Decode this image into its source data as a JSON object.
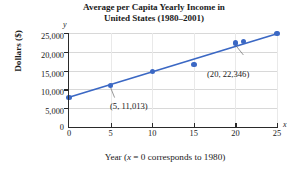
{
  "chart_data": {
    "type": "scatter",
    "title": "Average per Capita Yearly Income in United States (1980–2001)",
    "title_lines": [
      "Average per Capita Yearly Income in",
      "United States (1980–2001)"
    ],
    "xlabel": "Year (x = 0 corresponds to 1980)",
    "xlabel_parts": {
      "pre": "Year (",
      "italic": "x",
      "post": " = 0 corresponds to 1980)"
    },
    "ylabel": "Dollars ($)",
    "x_axis_name": "x",
    "y_axis_name": "y",
    "xlim": [
      0,
      25
    ],
    "ylim": [
      0,
      25000
    ],
    "xticks": [
      0,
      5,
      10,
      15,
      20,
      25
    ],
    "xtick_labels": [
      "0",
      "5",
      "10",
      "15",
      "20",
      "25"
    ],
    "yticks": [
      0,
      5000,
      10000,
      15000,
      20000,
      25000
    ],
    "ytick_labels": [
      "0",
      "5,000",
      "10,000",
      "15,000",
      "20,000",
      "25,000"
    ],
    "grid": true,
    "legend": false,
    "series_color": "#3b68c4",
    "grid_color": "#d8d8d8",
    "axis_color": "#2a2a2a",
    "x": [
      0,
      5,
      10,
      15,
      20,
      21,
      25
    ],
    "values": [
      7900,
      11013,
      14800,
      16700,
      22346,
      22800,
      24800
    ],
    "points": [
      {
        "x": 0,
        "y": 7900
      },
      {
        "x": 5,
        "y": 11013
      },
      {
        "x": 10,
        "y": 14800
      },
      {
        "x": 15,
        "y": 16700
      },
      {
        "x": 20,
        "y": 22346
      },
      {
        "x": 21,
        "y": 22800
      },
      {
        "x": 25,
        "y": 24800
      }
    ],
    "trendline": {
      "x0": 0,
      "y0": 7900,
      "x1": 25,
      "y1": 24800
    },
    "annotations": [
      {
        "text": "(5, 11,013)",
        "point_x": 5,
        "point_y": 11013
      },
      {
        "text": "(20, 22,346)",
        "point_x": 20,
        "point_y": 22346
      }
    ]
  }
}
